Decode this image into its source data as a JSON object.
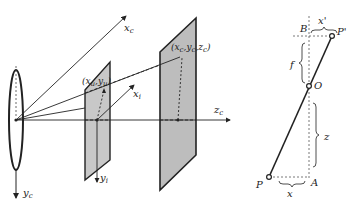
{
  "left_diagram": {
    "axes": {
      "xc": "x",
      "xc_sub": "c",
      "yc": "y",
      "yc_sub": "c",
      "zc": "z",
      "zc_sub": "c",
      "xi": "x",
      "xi_sub": "i",
      "yi": "y",
      "yi_sub": "i"
    },
    "points": {
      "image_point": "(x",
      "image_point_sub1": "u",
      "image_point_mid": ",y",
      "image_point_sub2": "u",
      "image_point_end": ")",
      "world_point": "(x",
      "world_point_sub1": "c",
      "world_point_mid1": ",y",
      "world_point_sub2": "c",
      "world_point_mid2": ",z",
      "world_point_sub3": "c",
      "world_point_end": ")"
    },
    "colors": {
      "plane_fill": "#c8c8c8",
      "far_plane_fill": "#bdbdbd",
      "line": "#222222"
    }
  },
  "right_diagram": {
    "labels": {
      "B": "B",
      "x_prime": "x'",
      "P_prime": "P'",
      "f": "f",
      "O": "O",
      "z": "z",
      "P": "P",
      "A": "A",
      "x": "x"
    }
  }
}
